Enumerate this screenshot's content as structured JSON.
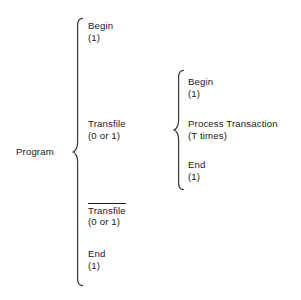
{
  "figure": {
    "type": "bracket-decomposition-diagram",
    "root": {
      "label": "Program"
    },
    "ink_color": "#3b3b3b",
    "text_color": "#1a1a1a",
    "background_color": "#ffffff"
  },
  "level1": {
    "brace_name": "program-brace",
    "items": [
      {
        "name": "Begin",
        "count": "(1)",
        "negated": false
      },
      {
        "name": "Transfile",
        "count": "(0 or 1)",
        "negated": false
      },
      {
        "name": "Transfile",
        "count": "(0 or 1)",
        "negated": true
      },
      {
        "name": "End",
        "count": "(1)",
        "negated": false
      }
    ]
  },
  "level2": {
    "brace_name": "transfile-brace",
    "parent_index": 1,
    "items": [
      {
        "name": "Begin",
        "count": "(1)",
        "negated": false
      },
      {
        "name": "Process Transaction",
        "count": "(T times)",
        "negated": false
      },
      {
        "name": "End",
        "count": "(1)",
        "negated": false
      }
    ]
  }
}
